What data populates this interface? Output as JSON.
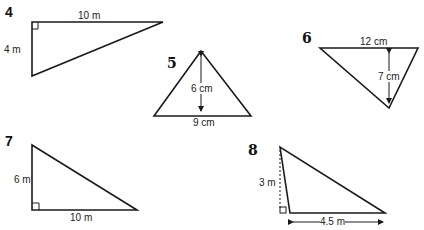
{
  "problems": [
    {
      "number": "4",
      "labels": {
        "top": "10 m",
        "left": "4 m"
      },
      "shape": "right-triangle"
    },
    {
      "number": "5",
      "labels": {
        "height": "6 cm",
        "base": "9 cm"
      },
      "shape": "isosceles-triangle"
    },
    {
      "number": "6",
      "labels": {
        "top": "12 cm",
        "height": "7 cm"
      },
      "shape": "inverted-triangle"
    },
    {
      "number": "7",
      "labels": {
        "left": "6 m",
        "base": "10 m"
      },
      "shape": "right-triangle"
    },
    {
      "number": "8",
      "labels": {
        "height": "3 m",
        "base": "4.5 m"
      },
      "shape": "obtuse-triangle"
    }
  ],
  "colors": {
    "stroke": "#1a1a1a",
    "background": "#ffffff"
  }
}
